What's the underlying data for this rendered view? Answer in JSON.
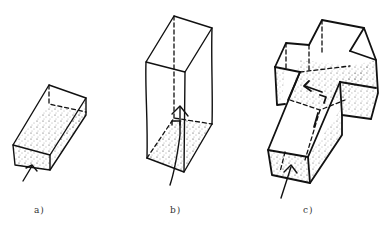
{
  "diagram": {
    "panels": [
      {
        "id": "a",
        "label": "a)",
        "description": "Low rectangular box (shallow space) viewed in perspective, stippled interior, arrow entering from the front short side"
      },
      {
        "id": "b",
        "label": "b)",
        "description": "Tall vertical box (shaft-like space), stippled floor, arrow entering from below pointing upward"
      },
      {
        "id": "c",
        "label": "c)",
        "description": "Cross-shaped volume made of intersecting boxes, stippled surfaces, arrow entering the long arm, inner arrows showing direction change"
      }
    ],
    "colors": {
      "ink": "#111111",
      "background": "#ffffff",
      "label": "#333333"
    }
  }
}
